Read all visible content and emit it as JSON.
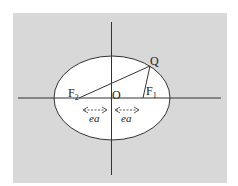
{
  "figure": {
    "background_color": "#ffffff",
    "panel_color": "#d8d8d8",
    "ellipse_fill": "#ffffff",
    "stroke_color": "#333333",
    "labels": {
      "focus_left": "F",
      "focus_left_sub": "2",
      "focus_right": "F",
      "focus_right_sub": "1",
      "center": "O",
      "point": "Q",
      "distance_left": "ea",
      "distance_right": "ea"
    }
  }
}
